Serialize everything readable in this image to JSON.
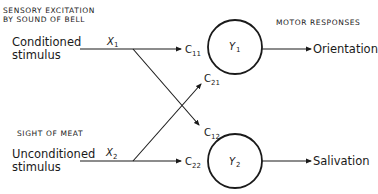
{
  "headings": {
    "top_left_line1": "SENSORY EXCITATION",
    "top_left_line2": "BY SOUND OF BELL",
    "bottom_left": "SIGHT OF MEAT",
    "top_right": "MOTOR RESPONSES"
  },
  "inputs": [
    {
      "label_line1": "Conditioned",
      "label_line2": "stimulus",
      "var": "X",
      "sub": "1"
    },
    {
      "label_line1": "Unconditioned",
      "label_line2": "stimulus",
      "var": "X",
      "sub": "2"
    }
  ],
  "weights": [
    {
      "id": "c11",
      "base": "C",
      "sub": "11"
    },
    {
      "id": "c21",
      "base": "C",
      "sub": "21"
    },
    {
      "id": "c12",
      "base": "C",
      "sub": "12"
    },
    {
      "id": "c22",
      "base": "C",
      "sub": "22"
    }
  ],
  "nodes": [
    {
      "var": "Y",
      "sub": "1",
      "output": "Orientation"
    },
    {
      "var": "Y",
      "sub": "2",
      "output": "Salivation"
    }
  ],
  "colors": {
    "stroke": "#1a1a1a",
    "background": "#ffffff"
  }
}
